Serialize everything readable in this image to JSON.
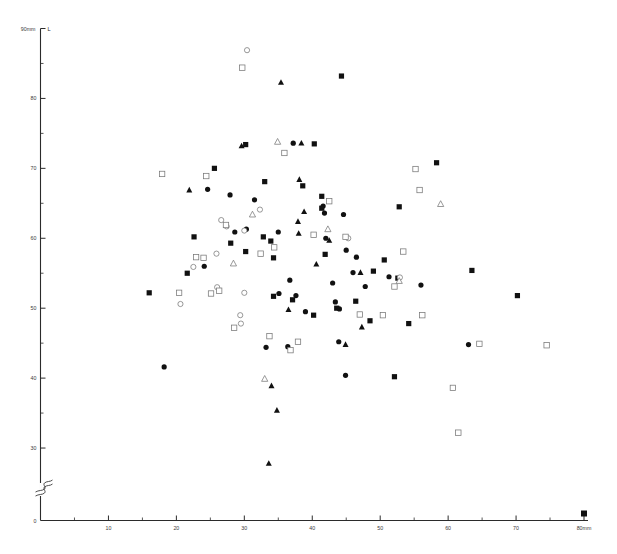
{
  "chart": {
    "type": "scatter",
    "title": "",
    "y_axis_top_label": "90mm",
    "y_axis_series_label": "L",
    "x_axis_end_label": "80mm",
    "origin_label": "0",
    "y_ticks": [
      "80",
      "70",
      "60",
      "50",
      "40",
      "30"
    ],
    "x_ticks": [
      "10",
      "20",
      "30",
      "40",
      "50",
      "60",
      "70"
    ],
    "axis_break_symbol": "S"
  },
  "chart_data": {
    "type": "scatter",
    "title": "",
    "xlabel": "80mm",
    "ylabel": "90mm",
    "xlim": [
      0,
      80
    ],
    "ylim": [
      0,
      90
    ],
    "y_broken_axis": true,
    "y_break_near": 22,
    "grid": false,
    "legend": "none",
    "xticks": [
      10,
      20,
      30,
      40,
      50,
      60,
      70,
      80
    ],
    "yticks": [
      30,
      40,
      50,
      60,
      70,
      80,
      90
    ],
    "xminor_step": 5,
    "yminor_step": 5,
    "marker_types": [
      "filled-circle",
      "filled-square",
      "filled-triangle",
      "open-circle",
      "open-square",
      "open-triangle"
    ],
    "series": [
      {
        "name": "filled-circle",
        "marker": "filled-circle",
        "points": [
          [
            37.2,
            73.6
          ],
          [
            24.6,
            67.0
          ],
          [
            27.9,
            66.2
          ],
          [
            31.5,
            65.5
          ],
          [
            41.6,
            64.6
          ],
          [
            41.8,
            63.6
          ],
          [
            44.6,
            63.4
          ],
          [
            30.3,
            61.3
          ],
          [
            28.6,
            60.9
          ],
          [
            35.0,
            60.9
          ],
          [
            42.0,
            60.0
          ],
          [
            45.0,
            58.3
          ],
          [
            46.5,
            57.3
          ],
          [
            24.1,
            56.0
          ],
          [
            46.0,
            55.1
          ],
          [
            51.3,
            54.5
          ],
          [
            36.7,
            54.0
          ],
          [
            43.0,
            53.6
          ],
          [
            47.8,
            53.1
          ],
          [
            56.0,
            53.3
          ],
          [
            35.1,
            52.1
          ],
          [
            37.6,
            51.8
          ],
          [
            43.4,
            50.9
          ],
          [
            44.0,
            49.9
          ],
          [
            43.9,
            45.2
          ],
          [
            33.2,
            44.4
          ],
          [
            36.4,
            44.5
          ],
          [
            18.2,
            41.6
          ],
          [
            44.9,
            40.4
          ],
          [
            63.0,
            44.8
          ],
          [
            39.0,
            49.5
          ]
        ]
      },
      {
        "name": "filled-square",
        "marker": "filled-square",
        "points": [
          [
            44.3,
            83.2
          ],
          [
            30.2,
            73.4
          ],
          [
            40.3,
            73.5
          ],
          [
            25.6,
            70.0
          ],
          [
            38.6,
            67.5
          ],
          [
            41.4,
            66.0
          ],
          [
            41.4,
            64.3
          ],
          [
            52.8,
            64.5
          ],
          [
            22.6,
            60.2
          ],
          [
            32.8,
            60.2
          ],
          [
            33.9,
            59.6
          ],
          [
            28.0,
            59.3
          ],
          [
            30.2,
            58.1
          ],
          [
            34.3,
            57.2
          ],
          [
            41.9,
            57.7
          ],
          [
            50.6,
            56.9
          ],
          [
            49.0,
            55.3
          ],
          [
            52.6,
            54.3
          ],
          [
            21.6,
            55.0
          ],
          [
            63.5,
            55.4
          ],
          [
            16.0,
            52.2
          ],
          [
            34.3,
            51.7
          ],
          [
            37.1,
            51.2
          ],
          [
            46.4,
            51.0
          ],
          [
            70.2,
            51.8
          ],
          [
            43.6,
            50.0
          ],
          [
            40.2,
            49.0
          ],
          [
            48.5,
            48.2
          ],
          [
            54.2,
            47.8
          ],
          [
            52.1,
            40.2
          ],
          [
            33.0,
            68.1
          ],
          [
            58.3,
            70.8
          ]
        ]
      },
      {
        "name": "filled-triangle",
        "marker": "filled-triangle",
        "points": [
          [
            35.4,
            82.3
          ],
          [
            29.6,
            73.2
          ],
          [
            38.4,
            73.6
          ],
          [
            21.9,
            66.9
          ],
          [
            38.1,
            68.4
          ],
          [
            38.8,
            63.8
          ],
          [
            37.9,
            62.4
          ],
          [
            38.0,
            60.7
          ],
          [
            42.5,
            59.7
          ],
          [
            40.6,
            56.3
          ],
          [
            47.1,
            55.1
          ],
          [
            36.5,
            49.8
          ],
          [
            47.3,
            47.3
          ],
          [
            44.9,
            44.8
          ],
          [
            34.0,
            38.9
          ],
          [
            34.8,
            35.4
          ],
          [
            33.6,
            27.8
          ]
        ]
      },
      {
        "name": "open-circle",
        "marker": "open-circle",
        "points": [
          [
            30.4,
            86.9
          ],
          [
            32.3,
            64.1
          ],
          [
            26.6,
            62.6
          ],
          [
            27.4,
            61.7
          ],
          [
            30.0,
            61.1
          ],
          [
            25.9,
            57.8
          ],
          [
            22.5,
            55.9
          ],
          [
            26.0,
            53.0
          ],
          [
            30.0,
            52.2
          ],
          [
            52.9,
            54.4
          ],
          [
            45.3,
            60.0
          ],
          [
            29.4,
            49.0
          ],
          [
            29.5,
            47.8
          ],
          [
            20.6,
            50.6
          ]
        ]
      },
      {
        "name": "open-square",
        "marker": "open-square",
        "points": [
          [
            29.7,
            84.4
          ],
          [
            17.9,
            69.2
          ],
          [
            24.4,
            68.9
          ],
          [
            35.9,
            72.2
          ],
          [
            55.2,
            69.9
          ],
          [
            55.8,
            66.9
          ],
          [
            42.5,
            65.3
          ],
          [
            27.3,
            61.9
          ],
          [
            40.2,
            60.5
          ],
          [
            44.9,
            60.2
          ],
          [
            34.4,
            58.7
          ],
          [
            32.4,
            57.8
          ],
          [
            22.9,
            57.3
          ],
          [
            24.0,
            57.2
          ],
          [
            53.4,
            58.1
          ],
          [
            52.1,
            53.1
          ],
          [
            20.4,
            52.2
          ],
          [
            25.1,
            52.1
          ],
          [
            26.3,
            52.5
          ],
          [
            47.0,
            49.1
          ],
          [
            50.4,
            49.0
          ],
          [
            28.5,
            47.2
          ],
          [
            33.7,
            46.0
          ],
          [
            37.9,
            45.2
          ],
          [
            36.8,
            44.0
          ],
          [
            64.6,
            44.9
          ],
          [
            74.5,
            44.7
          ],
          [
            60.7,
            38.6
          ],
          [
            61.5,
            32.2
          ],
          [
            56.2,
            49.0
          ]
        ]
      },
      {
        "name": "open-triangle",
        "marker": "open-triangle",
        "points": [
          [
            34.9,
            73.8
          ],
          [
            31.2,
            63.4
          ],
          [
            28.4,
            56.4
          ],
          [
            42.3,
            61.3
          ],
          [
            52.8,
            53.9
          ],
          [
            58.9,
            64.9
          ],
          [
            33.0,
            39.9
          ]
        ]
      }
    ]
  }
}
